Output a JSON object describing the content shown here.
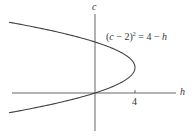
{
  "diagram": {
    "axes": {
      "vertical_label": "c",
      "horizontal_label": "h",
      "tick_labels": [
        "4"
      ]
    },
    "curve": {
      "equation_parts": {
        "open": "(",
        "var": "c",
        "minus_two": " − 2)",
        "exp": "2",
        "rhs_eq": " = 4 − ",
        "rhs_var": "h"
      },
      "description": "Parabola opening left with vertex at (h=4, c=2), passing through origin and (0,4)"
    },
    "colors": {
      "axis": "#555555",
      "curve": "#444444",
      "text": "#333333"
    }
  }
}
